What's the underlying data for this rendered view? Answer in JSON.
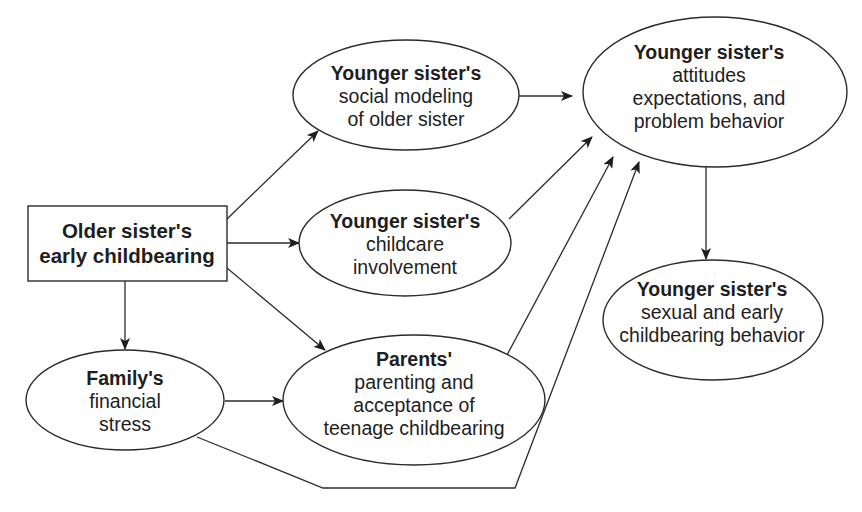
{
  "diagram": {
    "type": "path-model",
    "nodes": {
      "older_childbearing": {
        "shape": "rectangle",
        "title": "Older sister's",
        "lines": [
          "early childbearing"
        ]
      },
      "social_modeling": {
        "shape": "ellipse",
        "title": "Younger sister's",
        "lines": [
          "social modeling",
          "of older sister"
        ]
      },
      "childcare": {
        "shape": "ellipse",
        "title": "Younger sister's",
        "lines": [
          "childcare",
          "involvement"
        ]
      },
      "financial_stress": {
        "shape": "ellipse",
        "title": "Family's",
        "lines": [
          "financial",
          "stress"
        ]
      },
      "parenting": {
        "shape": "ellipse",
        "title": "Parents'",
        "lines": [
          "parenting and",
          "acceptance of",
          "teenage childbearing"
        ]
      },
      "attitudes": {
        "shape": "ellipse",
        "title": "Younger sister's",
        "lines": [
          "attitudes",
          "expectations, and",
          "problem behavior"
        ]
      },
      "sexual_behavior": {
        "shape": "ellipse",
        "title": "Younger sister's",
        "lines": [
          "sexual and early",
          "childbearing behavior"
        ]
      }
    },
    "edges": [
      {
        "from": "older_childbearing",
        "to": "social_modeling"
      },
      {
        "from": "older_childbearing",
        "to": "childcare"
      },
      {
        "from": "older_childbearing",
        "to": "parenting"
      },
      {
        "from": "older_childbearing",
        "to": "financial_stress"
      },
      {
        "from": "financial_stress",
        "to": "parenting"
      },
      {
        "from": "financial_stress",
        "to": "attitudes"
      },
      {
        "from": "social_modeling",
        "to": "attitudes"
      },
      {
        "from": "childcare",
        "to": "attitudes"
      },
      {
        "from": "parenting",
        "to": "attitudes"
      },
      {
        "from": "attitudes",
        "to": "sexual_behavior"
      }
    ],
    "colors": {
      "stroke": "#2b2b2b",
      "text": "#1e1e1e",
      "background": "#ffffff"
    }
  }
}
